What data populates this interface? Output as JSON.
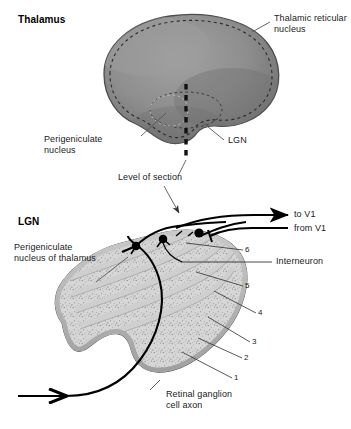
{
  "figure": {
    "title_top": "Thalamus",
    "title_bottom": "LGN",
    "background_color": "#ffffff",
    "thalamus_fill": "#8c8c8c",
    "thalamus_edge": "#4a4a4a",
    "lgn_fill": "#d8d8d8",
    "lgn_edge": "#555555",
    "line_color": "#555555",
    "axon_color": "#000000"
  },
  "top_panel": {
    "heading": "Thalamus",
    "labels": {
      "thalamic_reticular_nucleus": "Thalamic reticular\nnucleus",
      "thalamic_reticular_nucleus_line1": "Thalamic reticular",
      "thalamic_reticular_nucleus_line2": "nucleus",
      "perigeniculate_nucleus_line1": "Perigeniculate",
      "perigeniculate_nucleus_line2": "nucleus",
      "lgn": "LGN",
      "level_of_section": "Level of section"
    }
  },
  "bottom_panel": {
    "heading": "LGN",
    "labels": {
      "perigeniculate_line1": "Perigeniculate",
      "perigeniculate_line2": "nucleus of thalamus",
      "to_v1": "to V1",
      "from_v1": "from V1",
      "interneuron": "Interneuron",
      "retinal_axon_line1": "Retinal ganglion",
      "retinal_axon_line2": "cell axon"
    },
    "layer_numbers": [
      "1",
      "2",
      "3",
      "4",
      "5",
      "6"
    ]
  }
}
